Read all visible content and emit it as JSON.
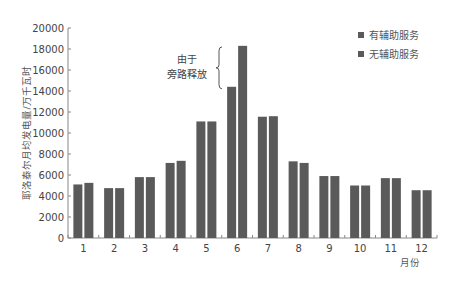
{
  "chart_data": {
    "type": "bar",
    "title": "",
    "xlabel": "月份",
    "ylabel": "耶洛泰尔月均发电量/万千瓦时",
    "ylim": [
      0,
      20000
    ],
    "yticks": [
      0,
      2000,
      4000,
      6000,
      8000,
      10000,
      12000,
      14000,
      16000,
      18000,
      20000
    ],
    "categories": [
      "1",
      "2",
      "3",
      "4",
      "5",
      "6",
      "7",
      "8",
      "9",
      "10",
      "11",
      "12"
    ],
    "series": [
      {
        "name": "有辅助服务",
        "color": "#5a5a5a",
        "values": [
          5100,
          4750,
          5800,
          7150,
          11100,
          14400,
          11550,
          7300,
          5900,
          5000,
          5700,
          4550
        ]
      },
      {
        "name": "无辅助服务",
        "color": "#5a5a5a",
        "values": [
          5250,
          4750,
          5800,
          7350,
          11100,
          18300,
          11600,
          7150,
          5900,
          5000,
          5700,
          4550
        ]
      }
    ],
    "legend_position": "top-right",
    "grid": false,
    "annotations": [
      {
        "text_lines": [
          "由于",
          "旁路释放"
        ],
        "target": "6",
        "type": "brace",
        "range": [
          14400,
          18300
        ]
      }
    ]
  }
}
